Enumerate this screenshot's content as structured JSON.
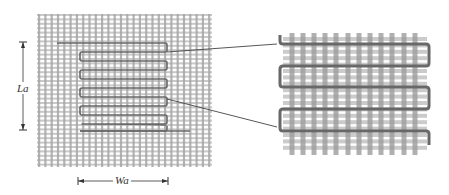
{
  "figure": {
    "labels": {
      "length": "La",
      "width": "Wa"
    },
    "colors": {
      "background": "#ffffff",
      "warp_yarn": "#a6a6a6",
      "weft_yarn": "#c9c9c9",
      "inset_warp_yarn": "#9c9c9c",
      "inset_weft_yarn": "#cbcbcb",
      "conductor": "#686868",
      "dimension_line": "#333333",
      "leader_line": "#444444"
    },
    "main_fabric": {
      "x": 37,
      "y": 14,
      "width": 175,
      "height": 153,
      "warp_pitch": 6.3,
      "weft_pitch": 4.4,
      "warp_width": 2.2,
      "weft_width": 2.0
    },
    "main_meander": {
      "start": [
        57,
        43
      ],
      "right_x": 167,
      "left_x": 80,
      "rows_y": [
        43,
        52,
        61,
        70,
        79,
        88,
        97,
        106,
        115,
        124
      ],
      "end": [
        190,
        131
      ],
      "stroke_width": 1.6
    },
    "leaders": [
      {
        "from": [
          167,
          52
        ],
        "to": [
          277,
          44
        ]
      },
      {
        "from": [
          167,
          99
        ],
        "to": [
          277,
          127
        ]
      }
    ],
    "inset": {
      "x": 283,
      "y": 33,
      "width": 144,
      "height": 122,
      "warp_x": [
        292,
        303,
        314,
        325,
        336,
        348,
        359,
        370,
        381,
        392,
        404,
        415
      ],
      "warp_width": 5,
      "weft_pitch": 6.4,
      "weft_width": 4,
      "meander_rows_y": [
        44,
        66,
        87,
        109,
        131
      ],
      "meander_left_x": 280,
      "meander_right_x": 429,
      "meander_start_y": 35,
      "meander_end_y": 145,
      "stroke_width": 3
    },
    "dimension_la": {
      "x": 23,
      "y1": 42,
      "y2": 130
    },
    "dimension_wa": {
      "y": 181,
      "x1": 78,
      "x2": 168
    }
  }
}
